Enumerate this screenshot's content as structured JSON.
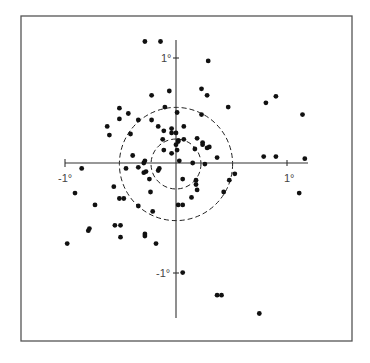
{
  "chart_data": {
    "type": "scatter",
    "title": "",
    "xlabel": "",
    "ylabel": "",
    "units": "degrees",
    "xlim": [
      -1.0,
      1.19
    ],
    "ylim": [
      -1.44,
      1.12
    ],
    "grid": false,
    "legend": null,
    "tick_labels": {
      "x_neg": "-1°",
      "x_pos": "1°",
      "y_pos": "1°",
      "y_neg": "-1°"
    },
    "reference_circles": [
      {
        "center": [
          0,
          0
        ],
        "radius_deg": 0.51,
        "style": "dashed"
      },
      {
        "center": [
          0,
          0
        ],
        "radius_deg": 0.225,
        "style": "dashed"
      }
    ],
    "points": [
      {
        "x": -0.28,
        "y": 1.13
      },
      {
        "x": -0.14,
        "y": 1.13
      },
      {
        "x": 0.29,
        "y": 0.95
      },
      {
        "x": -0.06,
        "y": 0.67
      },
      {
        "x": -0.22,
        "y": 0.63
      },
      {
        "x": 0.23,
        "y": 0.69
      },
      {
        "x": 0.28,
        "y": 0.63
      },
      {
        "x": 0.47,
        "y": 0.52
      },
      {
        "x": 0.81,
        "y": 0.56
      },
      {
        "x": 0.9,
        "y": 0.62
      },
      {
        "x": 1.14,
        "y": 0.45
      },
      {
        "x": -0.1,
        "y": 0.52
      },
      {
        "x": 0.01,
        "y": 0.47
      },
      {
        "x": 0.23,
        "y": 0.45
      },
      {
        "x": -0.51,
        "y": 0.51
      },
      {
        "x": -0.51,
        "y": 0.41
      },
      {
        "x": -0.43,
        "y": 0.46
      },
      {
        "x": -0.62,
        "y": 0.34
      },
      {
        "x": -0.6,
        "y": 0.26
      },
      {
        "x": -0.34,
        "y": 0.4
      },
      {
        "x": -0.22,
        "y": 0.4
      },
      {
        "x": -0.16,
        "y": 0.34
      },
      {
        "x": -0.11,
        "y": 0.3
      },
      {
        "x": -0.04,
        "y": 0.32
      },
      {
        "x": 0.07,
        "y": 0.34
      },
      {
        "x": -0.04,
        "y": 0.28
      },
      {
        "x": 0.0,
        "y": 0.28
      },
      {
        "x": -0.41,
        "y": 0.27
      },
      {
        "x": -0.12,
        "y": 0.22
      },
      {
        "x": 0.02,
        "y": 0.2
      },
      {
        "x": 0.07,
        "y": 0.22
      },
      {
        "x": 0.24,
        "y": 0.19
      },
      {
        "x": 0.0,
        "y": 0.17
      },
      {
        "x": -0.11,
        "y": 0.12
      },
      {
        "x": -0.04,
        "y": 0.09
      },
      {
        "x": 0.01,
        "y": 0.12
      },
      {
        "x": 0.02,
        "y": 0.21
      },
      {
        "x": 0.19,
        "y": 0.23
      },
      {
        "x": 0.24,
        "y": 0.17
      },
      {
        "x": 0.28,
        "y": 0.14
      },
      {
        "x": 0.3,
        "y": 0.15
      },
      {
        "x": 0.17,
        "y": 0.13
      },
      {
        "x": 0.37,
        "y": 0.05
      },
      {
        "x": -0.39,
        "y": 0.07
      },
      {
        "x": -0.28,
        "y": 0.02
      },
      {
        "x": -0.29,
        "y": 0.0
      },
      {
        "x": 0.03,
        "y": 0.02
      },
      {
        "x": 0.15,
        "y": 0.0
      },
      {
        "x": 0.26,
        "y": -0.01
      },
      {
        "x": 0.79,
        "y": 0.06
      },
      {
        "x": 0.9,
        "y": 0.06
      },
      {
        "x": 1.16,
        "y": 0.04
      },
      {
        "x": -0.85,
        "y": -0.05
      },
      {
        "x": -0.45,
        "y": -0.05
      },
      {
        "x": -0.34,
        "y": -0.04
      },
      {
        "x": -0.27,
        "y": -0.08
      },
      {
        "x": -0.29,
        "y": -0.09
      },
      {
        "x": -0.15,
        "y": -0.05
      },
      {
        "x": -0.16,
        "y": -0.07
      },
      {
        "x": -0.24,
        "y": -0.15
      },
      {
        "x": 0.53,
        "y": -0.1
      },
      {
        "x": 0.06,
        "y": -0.15
      },
      {
        "x": 0.18,
        "y": -0.16
      },
      {
        "x": 0.18,
        "y": -0.2
      },
      {
        "x": 0.19,
        "y": -0.25
      },
      {
        "x": 0.48,
        "y": -0.16
      },
      {
        "x": 0.43,
        "y": -0.27
      },
      {
        "x": -0.56,
        "y": -0.22
      },
      {
        "x": -0.23,
        "y": -0.27
      },
      {
        "x": -0.91,
        "y": -0.28
      },
      {
        "x": -0.51,
        "y": -0.33
      },
      {
        "x": -0.47,
        "y": -0.33
      },
      {
        "x": 0.14,
        "y": -0.32
      },
      {
        "x": -0.73,
        "y": -0.39
      },
      {
        "x": -0.34,
        "y": -0.4
      },
      {
        "x": -0.21,
        "y": -0.45
      },
      {
        "x": 0.02,
        "y": -0.39
      },
      {
        "x": 0.06,
        "y": -0.39
      },
      {
        "x": -0.55,
        "y": -0.58
      },
      {
        "x": -0.5,
        "y": -0.58
      },
      {
        "x": -0.78,
        "y": -0.61
      },
      {
        "x": -0.79,
        "y": -0.63
      },
      {
        "x": -0.5,
        "y": -0.69
      },
      {
        "x": -0.28,
        "y": -0.66
      },
      {
        "x": -0.28,
        "y": -0.68
      },
      {
        "x": -0.18,
        "y": -0.75
      },
      {
        "x": -0.98,
        "y": -0.75
      },
      {
        "x": 1.11,
        "y": -0.28
      },
      {
        "x": 0.06,
        "y": -1.02
      },
      {
        "x": 0.37,
        "y": -1.23
      },
      {
        "x": 0.41,
        "y": -1.23
      },
      {
        "x": 0.75,
        "y": -1.4
      }
    ]
  },
  "figure": {
    "x_neg_label": "-1°",
    "x_pos_label": "1°",
    "y_pos_label": "1°",
    "y_neg_label": "-1°"
  }
}
